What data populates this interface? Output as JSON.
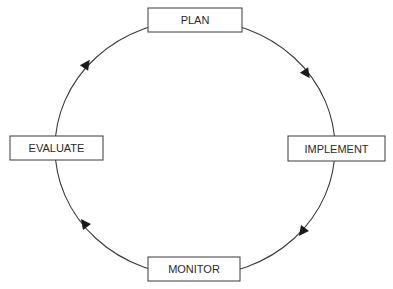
{
  "diagram": {
    "type": "cycle",
    "direction": "clockwise",
    "colors": {
      "stroke": "#3a3a3a",
      "text": "#2b2b2b",
      "background": "#ffffff",
      "box_fill": "#ffffff"
    },
    "nodes": [
      {
        "id": "plan",
        "label": "PLAN",
        "position": "top"
      },
      {
        "id": "implement",
        "label": "IMPLEMENT",
        "position": "right"
      },
      {
        "id": "monitor",
        "label": "MONITOR",
        "position": "bottom"
      },
      {
        "id": "evaluate",
        "label": "EVALUATE",
        "position": "left"
      }
    ],
    "edges": [
      {
        "from": "plan",
        "to": "implement"
      },
      {
        "from": "implement",
        "to": "monitor"
      },
      {
        "from": "monitor",
        "to": "evaluate"
      },
      {
        "from": "evaluate",
        "to": "plan"
      }
    ]
  }
}
